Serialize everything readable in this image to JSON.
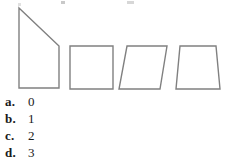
{
  "figure": {
    "name": "quadrilateral-shapes-figure",
    "stroke_color": "#808080",
    "fill_color": "#ffffff",
    "stroke_width": 1.4,
    "shapes": [
      {
        "name": "right-trapezoid",
        "label": "right trapezoid",
        "points": "19,8 59,46 59,88 19,88"
      },
      {
        "name": "square",
        "label": "square",
        "points": "70,46 113,46 113,89 70,89"
      },
      {
        "name": "parallelogram",
        "label": "parallelogram",
        "points": "127,46 167,46 160,89 119,89"
      },
      {
        "name": "trapezoid",
        "label": "trapezoid",
        "points": "180,46 216,46 220,89 176,89"
      }
    ]
  },
  "answers": {
    "name": "multiple-choice-answers",
    "options": [
      {
        "letter": "a.",
        "value": "0"
      },
      {
        "letter": "b.",
        "value": "1"
      },
      {
        "letter": "c.",
        "value": "2"
      },
      {
        "letter": "d.",
        "value": "3"
      }
    ]
  }
}
